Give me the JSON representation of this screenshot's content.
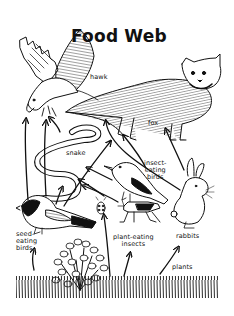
{
  "diagram": {
    "title": "Food Web",
    "colors": {
      "ink": "#111111",
      "background": "#ffffff"
    },
    "nodes": [
      {
        "id": "hawk",
        "label": "hawk",
        "icon": "hawk-icon"
      },
      {
        "id": "fox",
        "label": "fox",
        "icon": "fox-icon"
      },
      {
        "id": "snake",
        "label": "snake",
        "icon": "snake-icon"
      },
      {
        "id": "insect_eating_birds",
        "label": "insect-\neating\nbirds",
        "icon": "insect-eating-bird-icon"
      },
      {
        "id": "seed_eating_birds",
        "label": "seed-\neating\nbirds",
        "icon": "seed-eating-bird-icon"
      },
      {
        "id": "plant_eating_insects",
        "label": "plant-eating\ninsects",
        "icon": "insect-icon"
      },
      {
        "id": "rabbits",
        "label": "rabbits",
        "icon": "rabbit-icon"
      },
      {
        "id": "plants",
        "label": "plants",
        "icon": "plants-icon"
      }
    ],
    "edges": [
      {
        "from": "plants",
        "to": "seed_eating_birds"
      },
      {
        "from": "plants",
        "to": "plant_eating_insects"
      },
      {
        "from": "plants",
        "to": "rabbits"
      },
      {
        "from": "plants",
        "to": "snake"
      },
      {
        "from": "plant_eating_insects",
        "to": "insect_eating_birds"
      },
      {
        "from": "plant_eating_insects",
        "to": "snake"
      },
      {
        "from": "seed_eating_birds",
        "to": "hawk"
      },
      {
        "from": "seed_eating_birds",
        "to": "snake"
      },
      {
        "from": "seed_eating_birds",
        "to": "fox"
      },
      {
        "from": "insect_eating_birds",
        "to": "snake"
      },
      {
        "from": "insect_eating_birds",
        "to": "fox"
      },
      {
        "from": "snake",
        "to": "hawk"
      },
      {
        "from": "rabbits",
        "to": "fox"
      },
      {
        "from": "rabbits",
        "to": "hawk"
      }
    ]
  }
}
